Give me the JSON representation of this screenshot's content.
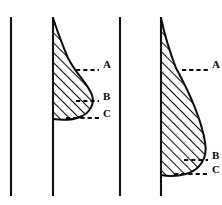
{
  "figure": {
    "title": "",
    "background_color": "#ffffff",
    "ink_color": "#0a0a0a",
    "hatch_angle_deg": 45,
    "panels": [
      {
        "id": "left-panel",
        "name": "left-diagram",
        "reference_line_left": {
          "name": "reference-line-1",
          "x": 11,
          "y_top": 17,
          "y_bottom": 196
        },
        "reference_line_right": {
          "name": "baseline-left-panel",
          "x": 53,
          "y_top": 17,
          "y_bottom": 196
        },
        "shape": {
          "name": "hatched-teardrop-left",
          "description": "narrow at top, swelling into a rounded bulb at the bottom, attached to the vertical baseline",
          "apex_y": 18,
          "base_y": 119,
          "max_width_x": 92
        },
        "levels": [
          {
            "label": "A",
            "y": 70,
            "dash_x_start": 76,
            "dash_x_end": 99,
            "label_x": 103,
            "label_y": 64
          },
          {
            "label": "B",
            "y": 101,
            "dash_x_start": 76,
            "dash_x_end": 99,
            "label_x": 103,
            "label_y": 96
          },
          {
            "label": "C",
            "y": 118,
            "dash_x_start": 68,
            "dash_x_end": 99,
            "label_x": 103,
            "label_y": 113
          }
        ]
      },
      {
        "id": "right-panel",
        "name": "right-diagram",
        "reference_line_left": {
          "name": "reference-line-2",
          "x": 120,
          "y_top": 17,
          "y_bottom": 196
        },
        "reference_line_right": {
          "name": "baseline-right-panel",
          "x": 161,
          "y_top": 17,
          "y_bottom": 196
        },
        "shape": {
          "name": "hatched-teardrop-right",
          "description": "narrow at top, swelling into a large rounded bulb that reaches far lower than the left shape",
          "apex_y": 18,
          "base_y": 175,
          "max_width_x": 205
        },
        "levels": [
          {
            "label": "A",
            "y": 70,
            "dash_x_start": 184,
            "dash_x_end": 208,
            "label_x": 212,
            "label_y": 64
          },
          {
            "label": "B",
            "y": 160,
            "dash_x_start": 184,
            "dash_x_end": 208,
            "label_x": 212,
            "label_y": 155
          },
          {
            "label": "C",
            "y": 174,
            "dash_x_start": 176,
            "dash_x_end": 208,
            "label_x": 212,
            "label_y": 169
          }
        ]
      }
    ]
  }
}
